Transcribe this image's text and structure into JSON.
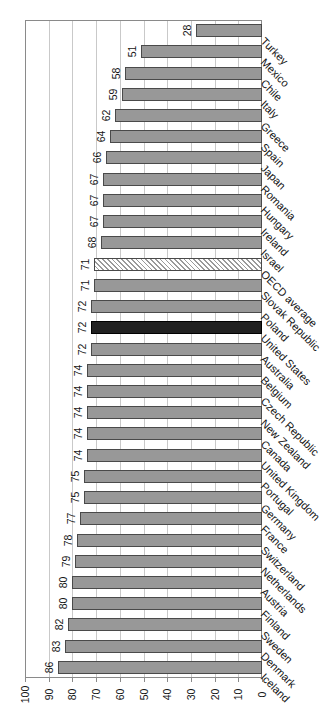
{
  "chart_data": {
    "type": "bar",
    "title": "",
    "legend": "none",
    "orientation": "horizontal bars attached to right baseline (landscape column chart rotated 90° counter-clockwise on portrait page)",
    "categories": [
      "Turkey",
      "Mexico",
      "Chile",
      "Italy",
      "Greece",
      "Spain",
      "Japan",
      "Romania",
      "Hungary",
      "Ireland",
      "Israel",
      "OECD average",
      "Slovak Republic",
      "Poland",
      "United States",
      "Australia",
      "Belgium",
      "Czech Republic",
      "New Zealand",
      "Canada",
      "United Kingdom",
      "Portugal",
      "Germany",
      "France",
      "Switzerland",
      "Netherlands",
      "Austria",
      "Finland",
      "Sweden",
      "Denmark",
      "Iceland"
    ],
    "values": [
      28,
      51,
      58,
      59,
      62,
      64,
      66,
      67,
      67,
      67,
      68,
      71,
      71,
      72,
      72,
      72,
      74,
      74,
      74,
      74,
      74,
      75,
      75,
      77,
      78,
      79,
      80,
      80,
      82,
      83,
      86
    ],
    "value_labels_shown": true,
    "bar_styles": {
      "United States": "solid-dark",
      "OECD average": "diagonal-hatch"
    },
    "value_axis": {
      "min": 0,
      "max": 100,
      "tick_step": 10,
      "ticks": [
        "0",
        "10",
        "20",
        "30",
        "40",
        "50",
        "60",
        "70",
        "80",
        "90",
        "100"
      ],
      "position": "bottom of page, 0 at right, 100 at left"
    },
    "grid": "major gridlines every 10 units, plot area framed",
    "colors": {
      "background": "#ffffff",
      "bar_fill": "#989898",
      "bar_border": "#4a4a4a",
      "dark_bar_fill": "#212121",
      "dark_bar_border": "#000000",
      "hatch_fill": "#ffffff",
      "hatch_stripe": "#9a9a9a",
      "gridline": "#c9c9c9",
      "frame": "#8a8a8a",
      "text": "#151515"
    }
  }
}
